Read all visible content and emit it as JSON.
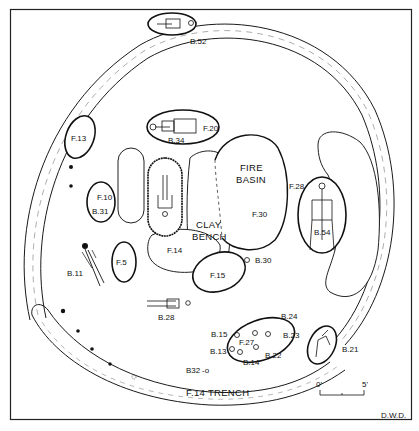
{
  "drawing": {
    "type": "archaeological site plan",
    "author_initials": "D.W.D.",
    "scale_bar": {
      "start_label": "0'",
      "end_label": "5'"
    }
  },
  "features": {
    "trench": "F.14 TRENCH",
    "fire_basin": {
      "title_line1": "FIRE",
      "title_line2": "BASIN",
      "id": "F.30"
    },
    "clay_bench": {
      "line1": "CLAY",
      "line2": "BENCH"
    },
    "f14": "F.14",
    "f13": "F.13",
    "f10": "F.10",
    "f5": "F.5",
    "f15": "F.15",
    "f20": "F.20",
    "f27": "F.27",
    "f28": "F.28"
  },
  "burials": {
    "b52": "B.52",
    "b34": "B.34",
    "b31": "B.31",
    "b11": "B.11",
    "b30": "B.30",
    "b28": "B.28",
    "b54": "B.54",
    "b24": "B.24",
    "b23": "B.23",
    "b22": "B.22",
    "b15": "B.15",
    "b13": "B.13",
    "b14": "B.14",
    "b32": "B32",
    "b21": "B.21"
  },
  "colors": {
    "ink": "#111111",
    "paper": "#ffffff"
  }
}
